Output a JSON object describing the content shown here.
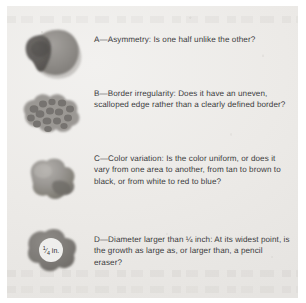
{
  "document": {
    "title": "ABCD warning signs of melanoma",
    "background_color": "#ece9e6",
    "text_color": "#3b3b3d",
    "lesion_color": "#8e8b88"
  },
  "items": [
    {
      "id": "a",
      "letter": "A",
      "term": "Asymmetry",
      "figure_name": "asymmetric-lesion-illustration",
      "figure_alt": "Dark irregular mole with two unequal overlapping lobes",
      "text": "A—Asymmetry: Is one half unlike the other?"
    },
    {
      "id": "b",
      "letter": "B",
      "term": "Border irregularity",
      "figure_name": "irregular-border-lesion-illustration",
      "figure_alt": "Mole with a scalloped, cobblestone-textured uneven edge",
      "text": "B—Border irregularity: Does it have an uneven, scalloped edge rather than a clearly defined border?"
    },
    {
      "id": "c",
      "letter": "C",
      "term": "Color variation",
      "figure_name": "color-variation-lesion-illustration",
      "figure_alt": "Mole shaded unevenly from light to dark across its surface",
      "text": "C—Color variation: Is the color uniform, or does it vary from one area to another, from tan to brown to black, or from white to red to blue?"
    },
    {
      "id": "d",
      "letter": "D",
      "term": "Diameter",
      "figure_name": "diameter-lesion-illustration",
      "figure_alt": "Mole overlaid with a white circle labeled one-quarter inch",
      "figure_label": "¼ in.",
      "figure_label_numerator": "1",
      "figure_label_denominator": "4",
      "figure_label_unit": "in.",
      "text": "D—Diameter larger than ¼ inch: At its widest point, is the growth as large as, or larger than, a pencil eraser?"
    }
  ]
}
